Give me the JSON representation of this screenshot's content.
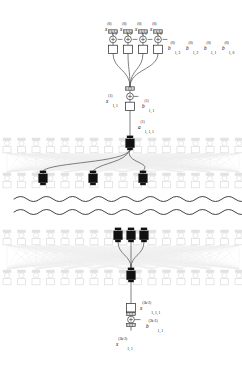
{
  "figure": {
    "colors": {
      "ink": "#1a1a1a",
      "node_fill": "#ffffff",
      "node_stroke": "#333333",
      "highlight_fill": "#111111",
      "faded": "#d9d9d9",
      "faded_line": "#e6e6e6",
      "edge": "#555555"
    }
  },
  "layers": [
    {
      "id": "layer-0",
      "kind": "input-row",
      "y": 40,
      "node_count": 4,
      "nodes": [
        {
          "cx": 113,
          "x_label": {
            "v": "x",
            "sup": "(0)",
            "sub": "1, 3"
          },
          "b_label": null
        },
        {
          "cx": 128,
          "x_label": {
            "v": "x",
            "sup": "(0)",
            "sub": "1, 2"
          },
          "b_label": null
        },
        {
          "cx": 143,
          "x_label": {
            "v": "x",
            "sup": "(0)",
            "sub": "1, 1"
          },
          "b_label": null
        },
        {
          "cx": 158,
          "x_label": {
            "v": "x",
            "sup": "(0)",
            "sub": "1, 0"
          },
          "b_label": null
        }
      ],
      "bias_labels": [
        {
          "v": "b",
          "sup": "(0)",
          "sub": "1, 3",
          "x": 168,
          "y": 37
        },
        {
          "v": "b",
          "sup": "(0)",
          "sub": "1, 2",
          "x": 186,
          "y": 37
        },
        {
          "v": "b",
          "sup": "(0)",
          "sub": "1, 1",
          "x": 204,
          "y": 37
        },
        {
          "v": "b",
          "sup": "(0)",
          "sub": "1, 0",
          "x": 222,
          "y": 37
        }
      ]
    },
    {
      "id": "layer-1",
      "kind": "merge-node",
      "cx": 130,
      "cy": 97,
      "x_label": {
        "v": "x",
        "sup": "(1)",
        "sub": "1, 1",
        "x": 106,
        "y": 90
      },
      "b_label": {
        "v": "b",
        "sup": "(1)",
        "sub": "1, 1",
        "x": 142,
        "y": 95
      },
      "out_label": {
        "v": "a",
        "sup": "(1)",
        "sub": "1, 1, 1",
        "x": 138,
        "y": 116
      }
    },
    {
      "id": "layer-k",
      "kind": "faded-array-upper",
      "row_y": 143,
      "faded_count": 17,
      "highlight": {
        "cx": 130,
        "cy": 143
      }
    },
    {
      "id": "layer-k2",
      "kind": "faded-array-lower",
      "row_y": 178,
      "faded_count": 17,
      "highlights": [
        {
          "cx": 43,
          "cy": 178
        },
        {
          "cx": 93,
          "cy": 178
        },
        {
          "cx": 143,
          "cy": 178
        }
      ]
    },
    {
      "id": "layer-m",
      "kind": "faded-array-upper-2",
      "row_y": 235,
      "faded_count": 17,
      "highlights": [
        {
          "cx": 118,
          "cy": 235
        },
        {
          "cx": 131,
          "cy": 235
        },
        {
          "cx": 144,
          "cy": 235
        }
      ]
    },
    {
      "id": "layer-m2",
      "kind": "faded-array-lower-2",
      "row_y": 275,
      "faded_count": 17,
      "highlight": {
        "cx": 131,
        "cy": 275
      }
    },
    {
      "id": "layer-out",
      "kind": "output-node",
      "cx": 131,
      "cy": 317,
      "x_label": {
        "v": "x",
        "sup": "(3k-2)",
        "sub": "1, 1, 1",
        "x": 140,
        "y": 297
      },
      "b_label": {
        "v": "b",
        "sup": "(3k-3)",
        "sub": "1, 1",
        "x": 146,
        "y": 315
      },
      "out_label": {
        "v": "x",
        "sup": "(3k-3)",
        "sub": "1, 1",
        "x": 116,
        "y": 333
      }
    }
  ],
  "separators": [
    {
      "id": "wavy-break-1",
      "y": 199
    },
    {
      "id": "wavy-break-2",
      "y": 212
    }
  ],
  "edges": {
    "top_fan_in": 4,
    "mid_fan_out": 3,
    "mid_fan_in": 3
  },
  "legend_note": ""
}
